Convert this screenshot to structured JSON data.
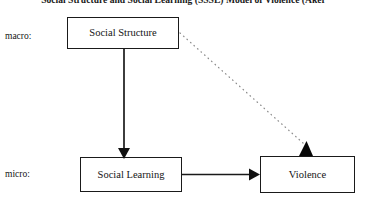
{
  "figure": {
    "title": "Social Structure and Social Learning (SSSL) Model of Violence (Aker",
    "background_color": "#ffffff",
    "line_color": "#1a1a1a",
    "text_color": "#141414"
  },
  "levels": {
    "macro_label": "macro:",
    "micro_label": "micro:"
  },
  "nodes": {
    "social_structure": {
      "label": "Social Structure",
      "level": "macro"
    },
    "social_learning": {
      "label": "Social Learning",
      "level": "micro"
    },
    "violence": {
      "label": "Violence",
      "level": "micro"
    }
  },
  "edges": [
    {
      "id": "structure-to-learning",
      "from": "Social Structure",
      "to": "Social Learning",
      "style": "solid",
      "arrowhead": "filled-triangle",
      "orientation": "vertical"
    },
    {
      "id": "learning-to-violence",
      "from": "Social Learning",
      "to": "Violence",
      "style": "solid",
      "arrowhead": "filled-triangle",
      "orientation": "horizontal"
    },
    {
      "id": "structure-to-violence",
      "from": "Social Structure",
      "to": "Violence",
      "style": "dotted",
      "arrowhead": "filled-triangle",
      "orientation": "diagonal"
    }
  ]
}
